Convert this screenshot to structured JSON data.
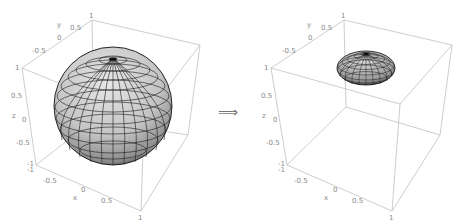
{
  "figure": {
    "arrow_symbol": "⟹",
    "colors": {
      "surface": "#c8c8c8",
      "mesh": "#1a1a1a",
      "box": "#b8b8b8",
      "ticks": "#888888"
    }
  },
  "plots": [
    {
      "name": "left",
      "object": "sphere",
      "axes": {
        "x": {
          "label": "x",
          "ticks": [
            "-1",
            "-0.5",
            "0",
            "0.5",
            "1"
          ]
        },
        "y": {
          "label": "y",
          "ticks": [
            "-0.5",
            "0",
            "0.5",
            "1"
          ]
        },
        "z": {
          "label": "z",
          "ticks": [
            "1",
            "0.5",
            "0",
            "-0.5",
            "-1"
          ]
        }
      }
    },
    {
      "name": "right",
      "object": "flattened ellipsoid",
      "axes": {
        "x": {
          "label": "x",
          "ticks": [
            "-1",
            "-0.5",
            "0",
            "0.5",
            "1"
          ]
        },
        "y": {
          "label": "y",
          "ticks": [
            "-0.5",
            "0",
            "0.5",
            "1"
          ]
        },
        "z": {
          "label": "z",
          "ticks": [
            "1",
            "0.5",
            "0",
            "-0.5",
            "-1"
          ]
        }
      }
    }
  ]
}
